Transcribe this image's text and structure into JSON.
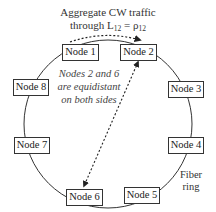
{
  "title": {
    "line1": "Aggregate CW traffic",
    "line2_prefix": "through L",
    "line2_sub1": "12",
    "line2_mid": " = ρ",
    "line2_sub2": "12"
  },
  "note": {
    "line1": "Nodes 2 and 6",
    "line2": "are equidistant",
    "line3": "on both sides"
  },
  "ring_label": {
    "line1": "Fiber",
    "line2": "ring"
  },
  "nodes": [
    {
      "label": "Node 1"
    },
    {
      "label": "Node 2"
    },
    {
      "label": "Node 3"
    },
    {
      "label": "Node 4"
    },
    {
      "label": "Node 5"
    },
    {
      "label": "Node 6"
    },
    {
      "label": "Node 7"
    },
    {
      "label": "Node 8"
    }
  ],
  "colors": {
    "stroke": "#333333",
    "background": "#ffffff"
  }
}
